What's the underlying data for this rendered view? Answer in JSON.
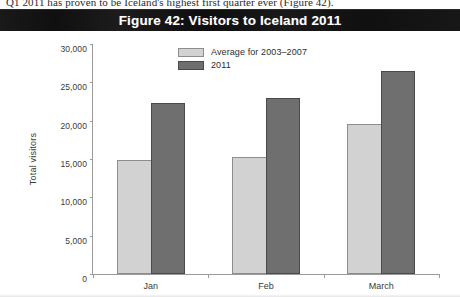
{
  "page": {
    "body_text_line": "Q1 2011 has proven to be Iceland's highest first quarter ever (Figure 42)."
  },
  "figure": {
    "title": "Figure 42: Visitors to Iceland 2011"
  },
  "chart_data": {
    "type": "bar",
    "title": "Figure 42: Visitors to Iceland 2011",
    "xlabel": "",
    "ylabel": "Total visitors",
    "categories": [
      "Jan",
      "Feb",
      "March"
    ],
    "series": [
      {
        "name": "Average for 2003–2007",
        "color": "#d2d2d2",
        "values": [
          14900,
          15200,
          19600
        ]
      },
      {
        "name": "2011",
        "color": "#6f6f6f",
        "values": [
          22300,
          22900,
          26500
        ]
      }
    ],
    "ylim": [
      0,
      30000
    ],
    "ytick_values": [
      0,
      5000,
      10000,
      15000,
      20000,
      25000,
      30000
    ],
    "ytick_labels": [
      "0",
      "5,000",
      "10,000",
      "15,000",
      "20,000",
      "25,000",
      "30,000"
    ],
    "grid": false,
    "legend_position": "top-center"
  },
  "colors": {
    "title_bar_bg": "#0b0b0b",
    "title_text": "#ffffff",
    "axis": "#9a9a9a",
    "tick_text": "#3a3a3a",
    "series_light": "#d2d2d2",
    "series_dark": "#6f6f6f"
  }
}
